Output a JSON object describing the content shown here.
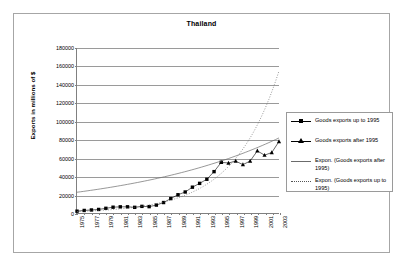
{
  "chart_data": {
    "type": "scatter",
    "title": "Thailand",
    "xlabel": "",
    "ylabel": "Exports in millions of $",
    "ylim": [
      0,
      180000
    ],
    "xlim": [
      1975,
      2003
    ],
    "grid": true,
    "legend_position": "right",
    "ytick_labels": [
      "0",
      "20000",
      "40000",
      "60000",
      "80000",
      "100000",
      "120000",
      "140000",
      "160000",
      "180000"
    ],
    "ytick_values": [
      0,
      20000,
      40000,
      60000,
      80000,
      100000,
      120000,
      140000,
      160000,
      180000
    ],
    "xtick_labels": [
      "1975",
      "1977",
      "1979",
      "1981",
      "1983",
      "1985",
      "1987",
      "1989",
      "1991",
      "1993",
      "1995",
      "1997",
      "1999",
      "2001",
      "2003"
    ],
    "xtick_values": [
      1975,
      1977,
      1979,
      1981,
      1983,
      1985,
      1987,
      1989,
      1991,
      1993,
      1995,
      1997,
      1999,
      2001,
      2003
    ],
    "series": [
      {
        "name": "Goods exports up to 1995",
        "marker": "square",
        "x": [
          1975,
          1976,
          1977,
          1978,
          1979,
          1980,
          1981,
          1982,
          1983,
          1984,
          1985,
          1986,
          1987,
          1988,
          1989,
          1990,
          1991,
          1992,
          1993,
          1994,
          1995
        ],
        "values": [
          2177,
          2973,
          3491,
          4054,
          5289,
          6505,
          6902,
          6945,
          6368,
          7413,
          7121,
          8803,
          11595,
          15902,
          20078,
          23072,
          28324,
          32473,
          36970,
          45262,
          55447
        ]
      },
      {
        "name": "Goods exports after 1995",
        "marker": "triangle",
        "x": [
          1995,
          1996,
          1997,
          1998,
          1999,
          2000,
          2001,
          2002,
          2003
        ],
        "values": [
          55447,
          54667,
          56725,
          52878,
          56801,
          67889,
          63207,
          66093,
          78104
        ]
      },
      {
        "name": "Expon. (Goods exports after 1995)",
        "marker": "none",
        "linestyle": "solid",
        "trend": "exponential",
        "x": [
          1975,
          2003
        ],
        "values": [
          22800,
          82000
        ]
      },
      {
        "name": "Expon. (Goods exports up to 1995)",
        "marker": "none",
        "linestyle": "dotted",
        "trend": "exponential",
        "x": [
          1975,
          2003
        ],
        "values": [
          1800,
          155000
        ]
      }
    ],
    "legend": [
      {
        "label": "Goods exports up to 1995",
        "key": "line-square-marker"
      },
      {
        "label": "Goods exports after 1995",
        "key": "line-triangle-marker"
      },
      {
        "label": "Expon. (Goods exports after 1995)",
        "key": "solid-line"
      },
      {
        "label": "Expon. (Goods exports up to 1995)",
        "key": "dotted-line"
      }
    ],
    "colors": {
      "series_marker": "#000000",
      "gridline": "#9a9a9a",
      "axis": "#808080",
      "frame": "#a6a6a6",
      "background": "#ffffff"
    }
  }
}
